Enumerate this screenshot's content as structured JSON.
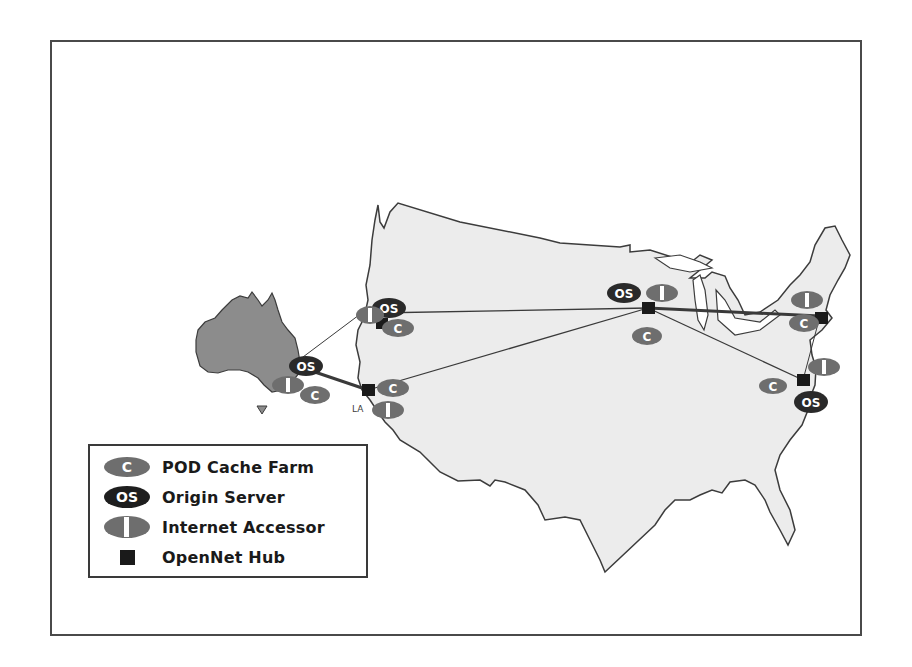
{
  "legend": {
    "items": [
      {
        "symbol": "C",
        "label": "POD Cache Farm",
        "icon": "cache-farm-icon"
      },
      {
        "symbol": "OS",
        "label": "Origin Server",
        "icon": "origin-server-icon"
      },
      {
        "symbol": "I",
        "label": "Internet Accessor",
        "icon": "internet-accessor-icon"
      },
      {
        "symbol": "",
        "label": "OpenNet Hub",
        "icon": "hub-icon"
      }
    ]
  },
  "map": {
    "labels": {
      "la": "LA"
    },
    "colors": {
      "us_fill": "#ececec",
      "australia_fill": "#8c8c8c",
      "outline": "#3c3c3c",
      "cache_fill": "#6e6e6e",
      "origin_fill": "#2a2a2a",
      "accessor_fill": "#6e6e6e",
      "hub_fill": "#1a1a1a"
    },
    "node_text": {
      "cache": "C",
      "origin": "OS",
      "accessor": "I"
    }
  }
}
